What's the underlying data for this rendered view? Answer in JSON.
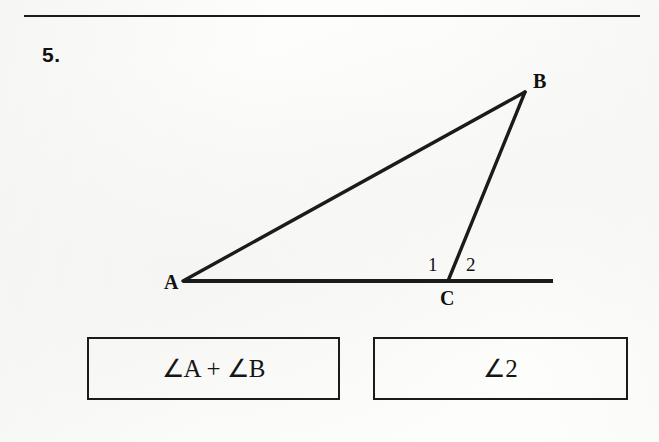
{
  "page": {
    "width": 659,
    "height": 442,
    "background_color": "#fdfdfc",
    "ink_color": "#1b1b1b"
  },
  "problem": {
    "number_label": "5."
  },
  "divider": {
    "name": "top-horizontal-rule"
  },
  "diagram": {
    "type": "geometry-figure",
    "vertices": [
      {
        "label": "A",
        "x": 183,
        "y": 281
      },
      {
        "label": "B",
        "x": 525,
        "y": 92
      },
      {
        "label": "C",
        "x": 448,
        "y": 281
      }
    ],
    "segments": [
      {
        "name": "AB",
        "from": "A",
        "to": "B"
      },
      {
        "name": "BC",
        "from": "B",
        "to": "C"
      },
      {
        "name": "base-line-through-A-C-extended",
        "from_x": 183,
        "to_x": 553,
        "y": 281
      }
    ],
    "angle_labels": [
      {
        "label": "1",
        "x": 433,
        "y": 265,
        "meaning": "interior angle BCA"
      },
      {
        "label": "2",
        "x": 472,
        "y": 265,
        "meaning": "exterior angle at C"
      }
    ],
    "vertex_labels": [
      {
        "label": "A",
        "x": 170,
        "y": 282
      },
      {
        "label": "B",
        "x": 538,
        "y": 80
      },
      {
        "label": "C",
        "x": 448,
        "y": 297
      }
    ]
  },
  "answer_boxes": [
    {
      "name": "answer-box-1",
      "text": "∠A + ∠B"
    },
    {
      "name": "answer-box-2",
      "text": "∠2"
    }
  ]
}
